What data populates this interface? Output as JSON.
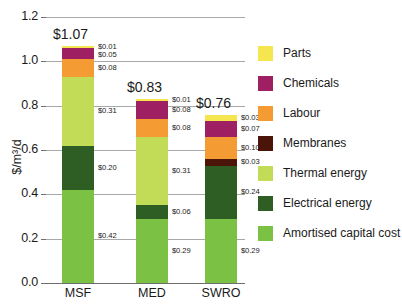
{
  "chart_data": {
    "type": "bar",
    "subtype": "stacked-bar",
    "title": "",
    "xlabel": "",
    "ylabel": "$/m³/d",
    "ylim": [
      0.0,
      1.2
    ],
    "ytick_labels": [
      "0.0",
      "0.2",
      "0.4",
      "0.6",
      "0.8",
      "1.0",
      "1.2"
    ],
    "ytick_values": [
      0.0,
      0.2,
      0.4,
      0.6,
      0.8,
      1.0,
      1.2
    ],
    "grid": true,
    "legend_position": "right",
    "categories": [
      "MSF",
      "MED",
      "SWRO"
    ],
    "totals": [
      1.07,
      0.83,
      0.76
    ],
    "total_labels": [
      "$1.07",
      "$0.83",
      "$0.76"
    ],
    "series": [
      {
        "name": "Parts",
        "color": "#F5E54E",
        "values": [
          0.01,
          0.01,
          0.03
        ],
        "labels": [
          "$0.01",
          "$0.01",
          "$0.03"
        ]
      },
      {
        "name": "Chemicals",
        "color": "#9E2063",
        "values": [
          0.05,
          0.08,
          0.07
        ],
        "labels": [
          "$0.05",
          "$0.08",
          "$0.07"
        ]
      },
      {
        "name": "Labour",
        "color": "#F59B34",
        "values": [
          0.08,
          0.08,
          0.1
        ],
        "labels": [
          "$0.08",
          "$0.08",
          "$0.10"
        ]
      },
      {
        "name": "Membranes",
        "color": "#4A1409",
        "values": [
          0.0,
          0.0,
          0.03
        ],
        "labels": [
          "",
          "",
          "$0.03"
        ]
      },
      {
        "name": "Thermal energy",
        "color": "#C3DC57",
        "values": [
          0.31,
          0.31,
          0.0
        ],
        "labels": [
          "$0.31",
          "$0.31",
          ""
        ]
      },
      {
        "name": "Electrical energy",
        "color": "#2E5E23",
        "values": [
          0.2,
          0.06,
          0.24
        ],
        "labels": [
          "$0.20",
          "$0.06",
          "$0.24"
        ]
      },
      {
        "name": "Amortised capital cost",
        "color": "#7BC143",
        "values": [
          0.42,
          0.29,
          0.29
        ],
        "labels": [
          "$0.42",
          "$0.29",
          "$0.29"
        ]
      }
    ]
  },
  "legend": {
    "items": [
      {
        "label": "Parts",
        "color": "#F5E54E"
      },
      {
        "label": "Chemicals",
        "color": "#9E2063"
      },
      {
        "label": "Labour",
        "color": "#F59B34"
      },
      {
        "label": "Membranes",
        "color": "#4A1409"
      },
      {
        "label": "Thermal energy",
        "color": "#C3DC57"
      },
      {
        "label": "Electrical energy",
        "color": "#2E5E23"
      },
      {
        "label": "Amortised capital cost",
        "color": "#7BC143"
      }
    ]
  }
}
